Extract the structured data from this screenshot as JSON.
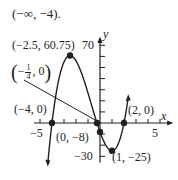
{
  "header_text": "(−∞, −4).",
  "chart_data": {
    "type": "line",
    "title": "",
    "function": "f(x) = (x + 4)(4x + 1)(x − 2)",
    "xlabel": "x",
    "ylabel": "y",
    "xlim": [
      -5.5,
      6
    ],
    "ylim": [
      -35,
      75
    ],
    "x_ticks_labeled": [
      -5,
      5
    ],
    "y_ticks_labeled": [
      70,
      -30
    ],
    "x_tick_step": 1,
    "y_tick_step": 10,
    "grid": false,
    "points": [
      {
        "x": -2.5,
        "y": 60.75,
        "label": "(−2.5, 60.75)",
        "kind": "local max"
      },
      {
        "x": -0.25,
        "y": 0,
        "label": "(−1/4, 0)",
        "kind": "x-intercept"
      },
      {
        "x": -4,
        "y": 0,
        "label": "(−4, 0)",
        "kind": "x-intercept"
      },
      {
        "x": 2,
        "y": 0,
        "label": "(2, 0)",
        "kind": "x-intercept"
      },
      {
        "x": 0,
        "y": -8,
        "label": "(0, −8)",
        "kind": "y-intercept"
      },
      {
        "x": 1,
        "y": -25,
        "label": "(1, −25)",
        "kind": "local min"
      }
    ]
  },
  "labels": {
    "max": "(−2.5, 60.75)",
    "quarter_neg": "−",
    "quarter_num": "1",
    "quarter_den": "4",
    "quarter_zero": ", 0",
    "neg4": "(−4, 0)",
    "two": "(2, 0)",
    "yint": "(0, −8)",
    "min": "(1, −25)",
    "xaxis": "x",
    "yaxis": "y",
    "tick_70": "70",
    "tick_neg30": "−30",
    "tick_neg5": "−5",
    "tick_5": "5"
  }
}
